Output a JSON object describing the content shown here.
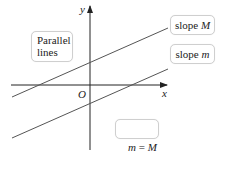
{
  "diagram": {
    "axes": {
      "x_label": "x",
      "y_label": "y",
      "origin_label": "O"
    },
    "lines": [
      {
        "name": "upper",
        "label_prefix": "slope ",
        "label_var": "M"
      },
      {
        "name": "lower",
        "label_prefix": "slope ",
        "label_var": "m"
      }
    ],
    "callouts": {
      "parallel_line1": "Parallel",
      "parallel_line2": "lines",
      "equality_left": "m",
      "equality_op": " = ",
      "equality_right": "M"
    },
    "colors": {
      "axis": "#222222",
      "line": "#555555",
      "box_border": "#cfcfcf"
    }
  }
}
